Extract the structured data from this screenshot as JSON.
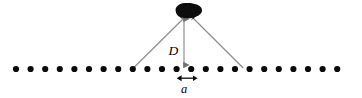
{
  "figure": {
    "type": "physics-diagram",
    "width": 362,
    "height": 98,
    "background_color": "#ffffff"
  },
  "labels": {
    "distance_label": "D",
    "spacing_label": "a"
  },
  "chart_data": {
    "type": "scatter",
    "title": "",
    "xlabel": "",
    "ylabel": "",
    "grid": false,
    "legend": null,
    "xlim": [
      0,
      362
    ],
    "ylim": [
      0,
      98
    ],
    "series": [
      {
        "name": "grating-dots",
        "marker": "filled-circle",
        "marker_color": "#0a0a0a",
        "marker_radius": 3.1,
        "count": 23,
        "y": 69,
        "x_start": 16,
        "x_spacing": 14.6,
        "x": [
          16,
          30.6,
          45.2,
          59.8,
          74.4,
          89,
          103.6,
          118.2,
          132.8,
          147.4,
          162,
          176.6,
          191.2,
          205.8,
          220.4,
          235,
          249.6,
          264.2,
          278.8,
          293.4,
          308,
          322.6,
          337.2
        ]
      }
    ],
    "annotations": [
      {
        "name": "source-blob",
        "shape": "irregular-ellipse",
        "color": "#0d0d0d",
        "cx": 188,
        "cy": 11,
        "rx": 14,
        "ry": 7.5
      },
      {
        "name": "ray-left",
        "shape": "line",
        "color": "#8a8a8a",
        "x1": 184,
        "y1": 16,
        "x2": 133,
        "y2": 69
      },
      {
        "name": "ray-right",
        "shape": "line",
        "color": "#8a8a8a",
        "x1": 194,
        "y1": 16,
        "x2": 243,
        "y2": 69
      },
      {
        "name": "distance-arrow",
        "shape": "double-arrow-vertical",
        "color": "#8a8a8a",
        "x": 184,
        "y1": 14,
        "y2": 69,
        "label": "D"
      },
      {
        "name": "spacing-arrow",
        "shape": "double-arrow-horizontal",
        "color": "#0a0a0a",
        "y": 78,
        "x1": 181,
        "x2": 194,
        "label": "a"
      }
    ]
  }
}
